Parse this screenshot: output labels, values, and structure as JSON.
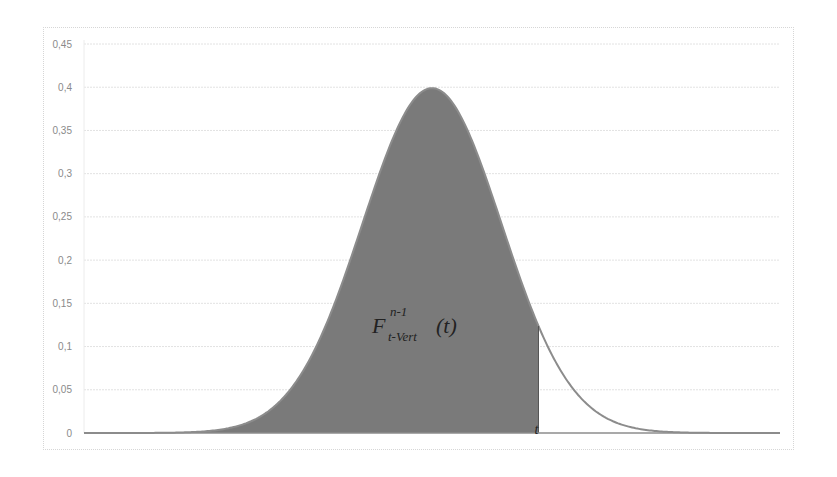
{
  "chart_data": {
    "type": "area",
    "title": "",
    "xlabel": "",
    "ylabel": "",
    "distribution": "standard normal probability density",
    "x_range": [
      -5,
      5
    ],
    "ylim": [
      0,
      0.45
    ],
    "y_ticks": [
      "0",
      "0,05",
      "0,1",
      "0,15",
      "0,2",
      "0,25",
      "0,3",
      "0,35",
      "0,4",
      "0,45"
    ],
    "y_tick_values": [
      0,
      0.05,
      0.1,
      0.15,
      0.2,
      0.25,
      0.3,
      0.35,
      0.4,
      0.45
    ],
    "grid": {
      "horizontal": true,
      "vertical": false
    },
    "legend": null,
    "peak": {
      "x": 0,
      "y": 0.399
    },
    "shaded_region": {
      "from": -5,
      "to": 1.53,
      "meaning": "cumulative probability up to t"
    },
    "cutoff_label": "t",
    "cutoff_x": 1.53,
    "cutoff_y": 0.124,
    "series": [
      {
        "name": "density",
        "x": [
          -5,
          -4.5,
          -4,
          -3.5,
          -3,
          -2.5,
          -2,
          -1.5,
          -1,
          -0.5,
          0,
          0.5,
          1,
          1.5,
          1.53,
          2,
          2.5,
          3,
          3.5,
          4,
          4.5,
          5
        ],
        "values": [
          0.0,
          0.0,
          0.0001,
          0.0009,
          0.0044,
          0.0175,
          0.054,
          0.1295,
          0.242,
          0.3521,
          0.3989,
          0.3521,
          0.242,
          0.1295,
          0.1238,
          0.054,
          0.0175,
          0.0044,
          0.0009,
          0.0001,
          0.0,
          0.0
        ]
      }
    ],
    "annotation": {
      "base": "F",
      "superscript": "n-1",
      "subscript": "t-Vert",
      "argument": "(t)",
      "full_text": "F^{n-1}_{t-Vert}(t)"
    },
    "colors": {
      "fill": "#7a7a7a",
      "line": "#8c8c8c",
      "grid": "#e2e2e2",
      "tick_text": "#8a8a8a"
    }
  }
}
